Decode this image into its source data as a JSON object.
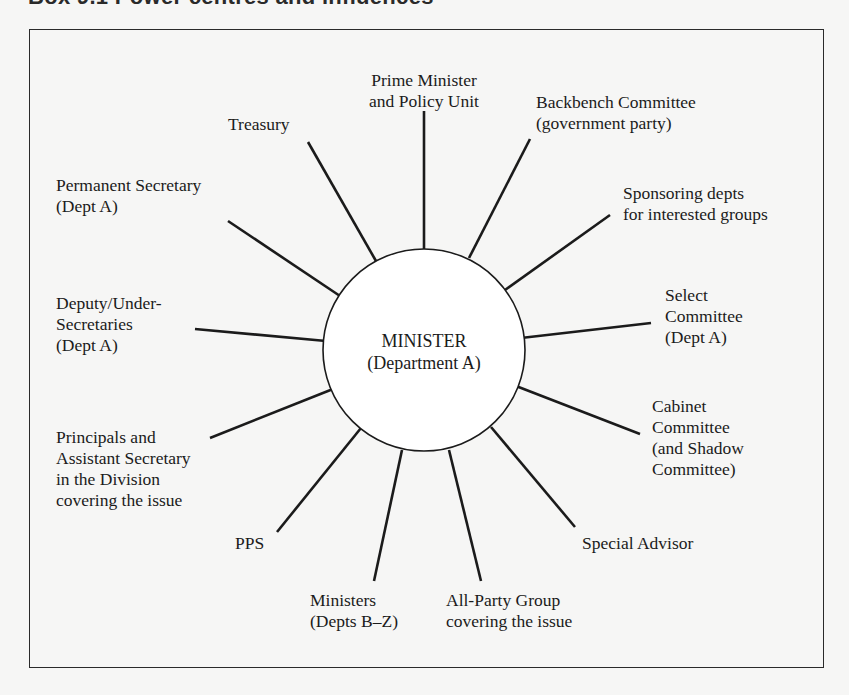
{
  "title": "Box 9.1  Power centres and influences",
  "center": {
    "line1": "MINISTER",
    "line2": "(Department A)"
  },
  "nodes": {
    "prime_minister": {
      "lines": [
        "Prime Minister",
        "and Policy Unit"
      ]
    },
    "treasury": {
      "lines": [
        "Treasury"
      ]
    },
    "backbench": {
      "lines": [
        "Backbench Committee",
        "(government party)"
      ]
    },
    "permanent_secretary": {
      "lines": [
        "Permanent Secretary",
        "(Dept A)"
      ]
    },
    "sponsoring": {
      "lines": [
        "Sponsoring depts",
        "for interested groups"
      ]
    },
    "deputy": {
      "lines": [
        "Deputy/Under-",
        "Secretaries",
        "(Dept A)"
      ]
    },
    "select_committee": {
      "lines": [
        "Select",
        "Committee",
        "(Dept A)"
      ]
    },
    "principals": {
      "lines": [
        "Principals and",
        "Assistant Secretary",
        "in the Division",
        "covering the issue"
      ]
    },
    "cabinet_committee": {
      "lines": [
        "Cabinet",
        "Committee",
        "(and Shadow",
        "Committee)"
      ]
    },
    "pps": {
      "lines": [
        "PPS"
      ]
    },
    "special_advisor": {
      "lines": [
        "Special Advisor"
      ]
    },
    "ministers": {
      "lines": [
        "Ministers",
        "(Depts B–Z)"
      ]
    },
    "all_party": {
      "lines": [
        "All-Party Group",
        "covering the issue"
      ]
    }
  },
  "colors": {
    "background": "#f6f6f5",
    "ink": "#1b1b1b",
    "circle_fill": "#ffffff"
  }
}
